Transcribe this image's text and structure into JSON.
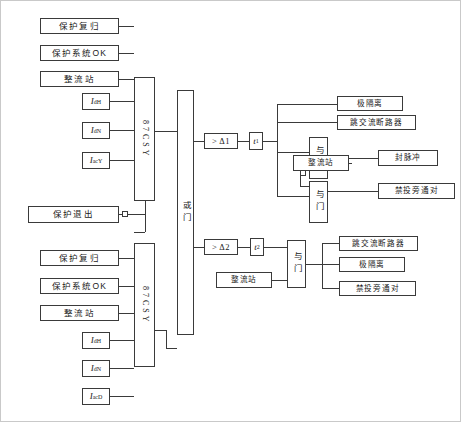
{
  "diagram": {
    "stroke_color": "#3a3a3a",
    "background": "#ffffff"
  },
  "upper_inputs": [
    {
      "id": "prot-reset-y",
      "label": "保护复归"
    },
    {
      "id": "prot-sys-ok-y",
      "label": "保护系统OK"
    },
    {
      "id": "rectifier-y",
      "label": "整流站"
    }
  ],
  "upper_currents": [
    {
      "id": "i-dh-y",
      "sym": "I",
      "sub": "dH"
    },
    {
      "id": "i-dn-y",
      "sym": "I",
      "sub": "dN"
    },
    {
      "id": "i-acy",
      "sym": "I",
      "sub": "acY"
    }
  ],
  "lower_inputs": [
    {
      "id": "prot-reset-d",
      "label": "保护复归"
    },
    {
      "id": "prot-sys-ok-d",
      "label": "保护系统OK"
    },
    {
      "id": "rectifier-d",
      "label": "整流站"
    }
  ],
  "lower_currents": [
    {
      "id": "i-dh-d",
      "sym": "I",
      "sub": "dH"
    },
    {
      "id": "i-dn-d",
      "sym": "I",
      "sub": "dN"
    },
    {
      "id": "i-acd",
      "sym": "I",
      "sub": "acD"
    }
  ],
  "prot_exit": {
    "label": "保护退出"
  },
  "relays": {
    "upper_label": "87CSY",
    "lower_label": "87CSY"
  },
  "or_gate": {
    "label": "或门"
  },
  "branch1": {
    "comparator": "> Δ1",
    "timer_sym": "t",
    "timer_sub": "1",
    "outputs": [
      {
        "id": "pole-isolation-1",
        "label": "极隔离"
      },
      {
        "id": "trip-ac-breaker-1",
        "label": "跳交流断路器"
      }
    ],
    "and_gate_1": {
      "label": "与门"
    },
    "and_gate_2": {
      "label": "与门"
    },
    "rectifier": {
      "label": "整流站"
    },
    "and1_output": {
      "id": "block-pulse",
      "label": "封脉冲"
    },
    "and2_output": {
      "id": "inhibit-bypass-pair-1",
      "label": "禁投旁通对"
    }
  },
  "branch2": {
    "comparator": "> Δ2",
    "timer_sym": "t",
    "timer_sub": "2",
    "rectifier": {
      "label": "整流站"
    },
    "and_gate": {
      "label": "与门"
    },
    "outputs": [
      {
        "id": "trip-ac-breaker-2",
        "label": "跳交流断路器"
      },
      {
        "id": "pole-isolation-2",
        "label": "极隔离"
      },
      {
        "id": "inhibit-bypass-pair-2",
        "label": "禁投旁通对"
      }
    ]
  }
}
